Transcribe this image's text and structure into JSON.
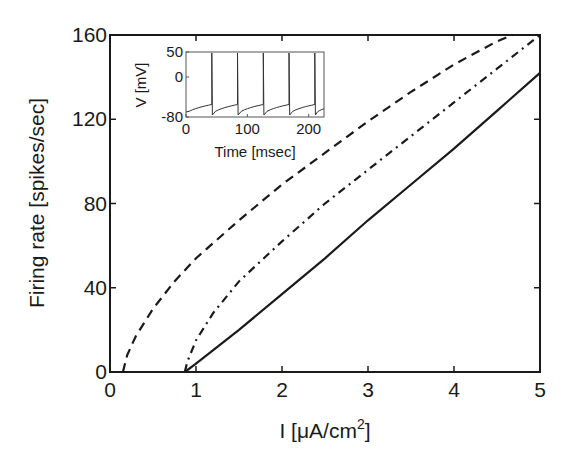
{
  "chart_data": {
    "type": "line",
    "title": "",
    "xlabel": "I [μA/cm²]",
    "xlabel_main": "I [μA/cm",
    "xlabel_sup": "2",
    "xlabel_tail": "]",
    "ylabel": "Firing rate [spikes/sec]",
    "xlim": [
      0,
      5
    ],
    "ylim": [
      0,
      160
    ],
    "xticks": [
      0,
      1,
      2,
      3,
      4,
      5
    ],
    "yticks": [
      0,
      40,
      80,
      120,
      160
    ],
    "grid": false,
    "legend": null,
    "series": [
      {
        "name": "dashed",
        "style": "dashed",
        "x": [
          0.15,
          0.2,
          0.3,
          0.5,
          0.75,
          1.0,
          1.5,
          2.0,
          2.5,
          3.0,
          3.5,
          4.0,
          4.5,
          4.68
        ],
        "y": [
          0,
          8,
          17,
          30,
          43,
          54,
          72,
          89,
          104,
          119,
          133,
          146,
          157,
          160
        ]
      },
      {
        "name": "dash-dot",
        "style": "dashdot",
        "x": [
          0.87,
          0.9,
          1.0,
          1.2,
          1.5,
          2.0,
          2.5,
          3.0,
          3.5,
          4.0,
          4.5,
          5.0
        ],
        "y": [
          0,
          5,
          15,
          28,
          43,
          62,
          80,
          96,
          112,
          128,
          144,
          160
        ]
      },
      {
        "name": "solid",
        "style": "solid",
        "x": [
          0.87,
          1.0,
          1.5,
          2.0,
          2.5,
          3.0,
          3.5,
          4.0,
          4.5,
          5.0
        ],
        "y": [
          0,
          4,
          20,
          37,
          54,
          72,
          89,
          106,
          124,
          142
        ]
      }
    ],
    "inset": {
      "type": "line",
      "xlabel": "Time [msec]",
      "ylabel": "V [mV]",
      "xlim": [
        0,
        225
      ],
      "ylim": [
        -80,
        50
      ],
      "xticks": [
        0,
        100,
        200
      ],
      "yticks": [
        -80,
        0,
        50
      ],
      "spike_times_ms": [
        42,
        84,
        126,
        168,
        210
      ],
      "resting_mV": -70,
      "peak_mV": 48,
      "pre_spike_mV": -55
    }
  }
}
